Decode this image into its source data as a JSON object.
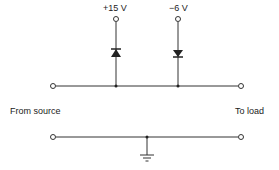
{
  "diagram": {
    "labels": {
      "supply_positive": "+15 V",
      "supply_negative": "−6 V",
      "input": "From source",
      "output": "To load"
    },
    "components": [
      {
        "type": "diode",
        "orientation": "anode-down (pointing up)",
        "connected_to": "+15 V"
      },
      {
        "type": "diode",
        "orientation": "pointing down",
        "connected_to": "−6 V"
      },
      {
        "type": "ground",
        "connected_to": "bottom rail"
      }
    ],
    "colors": {
      "line": "#333333",
      "background": "#ffffff"
    }
  }
}
